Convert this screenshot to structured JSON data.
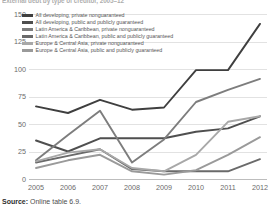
{
  "title": "External debt by type of creditor, 2005–12",
  "source": {
    "label": "Source:",
    "text": "Online table 6.9."
  },
  "chart_data": {
    "type": "line",
    "title": "External debt by type of creditor, 2005–12",
    "xlabel": "",
    "ylabel": "",
    "x": [
      "2005",
      "2006",
      "2007",
      "2008",
      "2009",
      "2010",
      "2011",
      "2012"
    ],
    "categories": [
      "2005",
      "2006",
      "2007",
      "2008",
      "2009",
      "2010",
      "2011",
      "2012"
    ],
    "ylim": [
      0,
      150
    ],
    "yticks": [
      0,
      25,
      50,
      75,
      100,
      125,
      150
    ],
    "grid": true,
    "legend_position": "top-left-inside",
    "series": [
      {
        "name": "All developing, private nonguaranteed",
        "color": "#3f3f3f",
        "values": [
          66,
          60,
          72,
          63,
          65,
          99,
          99,
          141
        ]
      },
      {
        "name": "All developing, public and publicly guaranteed",
        "color": "#4f4f4f",
        "values": [
          35,
          25,
          37,
          37,
          37,
          43,
          46,
          57
        ]
      },
      {
        "name": "Latin America & Caribbean, private nonguaranteed",
        "color": "#7d7d7d",
        "values": [
          17,
          40,
          62,
          15,
          36,
          70,
          81,
          91
        ]
      },
      {
        "name": "Latin America & Caribbean, public and publicly guaranteed",
        "color": "#6a6a6a",
        "values": [
          15,
          21,
          27,
          9,
          7,
          7,
          7,
          18
        ]
      },
      {
        "name": "Europe & Central Asia, private nonguaranteed",
        "color": "#a8a8a8",
        "values": [
          16,
          24,
          27,
          10,
          7,
          22,
          52,
          57
        ]
      },
      {
        "name": "Europe & Central Asia, public and publicly guaranteed",
        "color": "#9a9a9a",
        "values": [
          10,
          17,
          22,
          7,
          4,
          8,
          22,
          38
        ]
      }
    ]
  },
  "legend": {
    "items": [
      {
        "label": "All developing, private nonguaranteed",
        "color": "#3f3f3f"
      },
      {
        "label": "All developing, public and publicly guaranteed",
        "color": "#4f4f4f"
      },
      {
        "label": "Latin America & Caribbean, private nonguaranteed",
        "color": "#7d7d7d"
      },
      {
        "label": "Latin America & Caribbean, public and publicly guaranteed",
        "color": "#6a6a6a"
      },
      {
        "label": "Europe & Central Asia, private nonguaranteed",
        "color": "#a8a8a8"
      },
      {
        "label": "Europe & Central Asia, public and publicly guaranteed",
        "color": "#9a9a9a"
      }
    ]
  }
}
